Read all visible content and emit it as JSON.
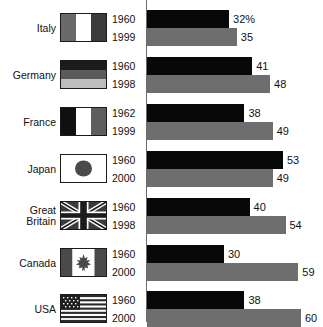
{
  "chart_data": {
    "type": "bar",
    "orientation": "horizontal",
    "title": "",
    "xlabel": "",
    "ylabel": "",
    "xlim": [
      0,
      62
    ],
    "grid": false,
    "legend_position": "none",
    "value_suffix": "%",
    "categories": [
      "Italy",
      "Germany",
      "France",
      "Japan",
      "Great Britain",
      "Canada",
      "USA"
    ],
    "series": [
      {
        "name": "earlier year",
        "color": "#080808",
        "years": [
          "1960",
          "1960",
          "1962",
          "1960",
          "1960",
          "1960",
          "1960"
        ],
        "values": [
          32,
          41,
          38,
          53,
          40,
          30,
          38
        ],
        "labels": [
          "32%",
          "41",
          "38",
          "53",
          "40",
          "30",
          "38"
        ]
      },
      {
        "name": "later year",
        "color": "#6e6e6e",
        "years": [
          "1999",
          "1998",
          "1999",
          "2000",
          "1998",
          "2000",
          "2000"
        ],
        "values": [
          35,
          48,
          49,
          49,
          54,
          59,
          60
        ],
        "labels": [
          "35",
          "48",
          "49",
          "49",
          "54",
          "59",
          "60"
        ]
      }
    ]
  },
  "rows": [
    {
      "country": "Italy",
      "country_line1": "Italy",
      "country_line2": "",
      "flag": "flag-italy",
      "year_old": "1960",
      "year_new": "1999",
      "value_old": 32,
      "value_new": 35,
      "label_old": "32%",
      "label_new": "35"
    },
    {
      "country": "Germany",
      "country_line1": "Germany",
      "country_line2": "",
      "flag": "flag-germany",
      "year_old": "1960",
      "year_new": "1998",
      "value_old": 41,
      "value_new": 48,
      "label_old": "41",
      "label_new": "48"
    },
    {
      "country": "France",
      "country_line1": "France",
      "country_line2": "",
      "flag": "flag-france",
      "year_old": "1962",
      "year_new": "1999",
      "value_old": 38,
      "value_new": 49,
      "label_old": "38",
      "label_new": "49"
    },
    {
      "country": "Japan",
      "country_line1": "Japan",
      "country_line2": "",
      "flag": "flag-japan",
      "year_old": "1960",
      "year_new": "2000",
      "value_old": 53,
      "value_new": 49,
      "label_old": "53",
      "label_new": "49"
    },
    {
      "country": "Great Britain",
      "country_line1": "Great",
      "country_line2": "Britain",
      "flag": "flag-great-britain",
      "year_old": "1960",
      "year_new": "1998",
      "value_old": 40,
      "value_new": 54,
      "label_old": "40",
      "label_new": "54"
    },
    {
      "country": "Canada",
      "country_line1": "Canada",
      "country_line2": "",
      "flag": "flag-canada",
      "year_old": "1960",
      "year_new": "2000",
      "value_old": 30,
      "value_new": 59,
      "label_old": "30",
      "label_new": "59"
    },
    {
      "country": "USA",
      "country_line1": "USA",
      "country_line2": "",
      "flag": "flag-usa",
      "year_old": "1960",
      "year_new": "2000",
      "value_old": 38,
      "value_new": 60,
      "label_old": "38",
      "label_new": "60"
    }
  ],
  "caption": {
    "text": ""
  },
  "colors": {
    "bar_old": "#080808",
    "bar_new": "#6e6e6e",
    "axis": "#6b6b6b",
    "text": "#111111",
    "background": "#ffffff"
  }
}
